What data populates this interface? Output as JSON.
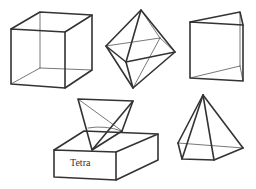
{
  "figure": {
    "shapes": [
      {
        "id": "cube",
        "name": "Cube"
      },
      {
        "id": "octahedron",
        "name": "Octahedron"
      },
      {
        "id": "triangular-prism",
        "name": "Triangular prism"
      },
      {
        "id": "tetrahedron-on-box",
        "name": "Tetrahedron on box"
      },
      {
        "id": "square-pyramid",
        "name": "Square pyramid"
      }
    ],
    "box_label": "Tetra"
  },
  "colors": {
    "stroke": "#333333",
    "background": "#ffffff"
  }
}
